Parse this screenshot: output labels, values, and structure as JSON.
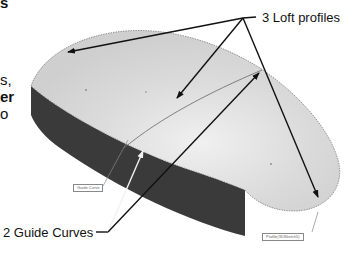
{
  "left_text_fragments": [
    {
      "text": "s",
      "bold": true
    },
    {
      "text": "s,",
      "bold": false
    },
    {
      "text": "er",
      "bold": true
    },
    {
      "text": "o",
      "bold": false
    }
  ],
  "callouts": {
    "loft_profiles": "3 Loft profiles",
    "guide_curves": "2 Guide Curves"
  },
  "model_tags": {
    "guide_curve": "Guide Curve",
    "profile": "Profile(3DSketch5)"
  },
  "colors": {
    "top_surface": "#d4d4d4",
    "top_surface_highlight": "#ececec",
    "side_face": "#3a3a3a",
    "arrow": "#111111",
    "guide_arrow_white": "#f2f2f2",
    "edge_line": "#777777"
  }
}
